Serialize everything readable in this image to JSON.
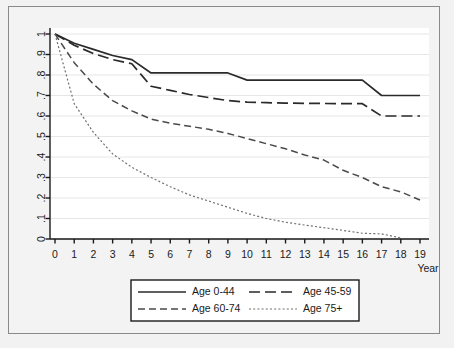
{
  "chart_data": {
    "type": "line",
    "title": "",
    "subtitle": "",
    "xlabel": "Year",
    "ylabel": "",
    "xlim": [
      0,
      19
    ],
    "ylim": [
      0,
      1
    ],
    "grid": true,
    "grid_axis": "y",
    "legend_position": "bottom",
    "x_ticks": [
      "0",
      "1",
      "2",
      "3",
      "4",
      "5",
      "6",
      "7",
      "8",
      "9",
      "10",
      "11",
      "12",
      "13",
      "14",
      "15",
      "16",
      "17",
      "18",
      "19"
    ],
    "y_ticks": [
      "0",
      ".1",
      ".2",
      ".3",
      ".4",
      ".5",
      ".6",
      ".7",
      ".8",
      ".9",
      "1"
    ],
    "x": [
      0,
      1,
      2,
      3,
      4,
      5,
      6,
      7,
      8,
      9,
      10,
      11,
      12,
      13,
      14,
      15,
      16,
      17,
      18,
      19
    ],
    "series": [
      {
        "name": "Age 0-44",
        "style": "solid",
        "color": "#2a2a2a",
        "values": [
          1.0,
          0.955,
          0.925,
          0.895,
          0.875,
          0.81,
          0.81,
          0.81,
          0.81,
          0.81,
          0.775,
          0.775,
          0.775,
          0.775,
          0.775,
          0.775,
          0.775,
          0.7,
          0.7,
          0.7
        ]
      },
      {
        "name": "Age 45-59",
        "style": "long-dash",
        "color": "#2a2a2a",
        "values": [
          1.0,
          0.945,
          0.905,
          0.875,
          0.855,
          0.745,
          0.725,
          0.705,
          0.69,
          0.675,
          0.668,
          0.665,
          0.663,
          0.662,
          0.661,
          0.66,
          0.66,
          0.6,
          0.6,
          0.6
        ]
      },
      {
        "name": "Age 60-74",
        "style": "dash",
        "color": "#4a4a4a",
        "values": [
          1.0,
          0.86,
          0.755,
          0.675,
          0.625,
          0.585,
          0.565,
          0.55,
          0.535,
          0.515,
          0.49,
          0.465,
          0.44,
          0.41,
          0.385,
          0.335,
          0.3,
          0.255,
          0.23,
          0.19
        ]
      },
      {
        "name": "Age 75+",
        "style": "dotted",
        "color": "#707070",
        "values": [
          1.0,
          0.66,
          0.52,
          0.415,
          0.35,
          0.3,
          0.255,
          0.215,
          0.185,
          0.155,
          0.125,
          0.1,
          0.082,
          0.068,
          0.055,
          0.042,
          0.028,
          0.025,
          0.005,
          null
        ]
      }
    ],
    "legend": [
      {
        "label": "Age 0-44",
        "style": "solid"
      },
      {
        "label": "Age 45-59",
        "style": "long-dash"
      },
      {
        "label": "Age 60-74",
        "style": "dash"
      },
      {
        "label": "Age 75+",
        "style": "dotted"
      }
    ]
  },
  "colors": {
    "background": "#f2f2f2",
    "plot_area": "#ffffff",
    "frame": "#8a8a8a",
    "axis": "#1a1a1a",
    "gridline": "#e6e6ea"
  }
}
